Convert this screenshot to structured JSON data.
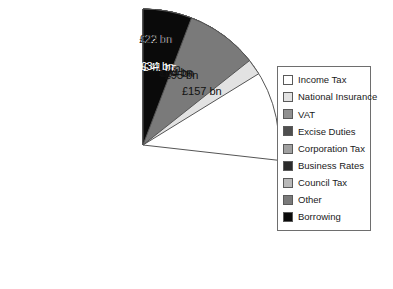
{
  "chart_data": {
    "type": "pie",
    "title": "",
    "units": "£ bn",
    "total": 586,
    "legend_position": "right",
    "grid": false,
    "start_angle_deg": 0,
    "direction": "clockwise",
    "categories": [
      "Income Tax",
      "National Insurance",
      "VAT",
      "Excise Duties",
      "Council Tax",
      "Business Rates",
      "Corporation Tax",
      "Other",
      "Borrowing"
    ],
    "values": [
      157,
      95,
      80,
      41,
      50,
      22,
      23,
      84,
      34
    ],
    "data_labels": [
      "£157 bn",
      "£95 bn",
      "£80 bn",
      "£41 bn",
      "£50 bn",
      "£22 bn",
      "£23 bn",
      "£84 bn",
      "£34 bn"
    ],
    "colors": [
      "#ffffff",
      "#e2e2e2",
      "#909090",
      "#4f4f4f",
      "#b9b9b9",
      "#2b2b2b",
      "#a0a0a0",
      "#7a7a7a",
      "#0a0a0a"
    ],
    "label_text_colors": [
      "#111111",
      "#111111",
      "#111111",
      "#ffffff",
      "#111111",
      "#ffffff",
      "#111111",
      "#111111",
      "#ffffff"
    ]
  },
  "legend": {
    "items": [
      {
        "label": "Income Tax",
        "color": "#ffffff"
      },
      {
        "label": "National Insurance",
        "color": "#e2e2e2"
      },
      {
        "label": "VAT",
        "color": "#909090"
      },
      {
        "label": "Excise Duties",
        "color": "#4f4f4f"
      },
      {
        "label": "Corporation Tax",
        "color": "#a0a0a0"
      },
      {
        "label": "Business Rates",
        "color": "#2b2b2b"
      },
      {
        "label": "Council Tax",
        "color": "#b9b9b9"
      },
      {
        "label": "Other",
        "color": "#7a7a7a"
      },
      {
        "label": "Borrowing",
        "color": "#0a0a0a"
      }
    ]
  },
  "geometry": {
    "center_x": 143,
    "center_y": 145,
    "radius": 136,
    "stroke": "#555555"
  }
}
